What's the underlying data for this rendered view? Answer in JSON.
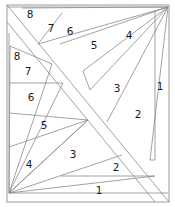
{
  "figure": {
    "title": "",
    "background_color": "#ffffff",
    "stroke_color": "#808080",
    "label_color": "#1a1a1a",
    "width": 175,
    "height": 207,
    "fans": [
      {
        "name": "top-right-fan",
        "apex": "top-right-corner",
        "labels": [
          "1",
          "2",
          "3",
          "4",
          "5",
          "6",
          "7",
          "8"
        ]
      },
      {
        "name": "bottom-left-fan",
        "apex": "bottom-left-corner",
        "labels": [
          "1",
          "2",
          "3",
          "4",
          "5",
          "6",
          "7",
          "8"
        ]
      }
    ],
    "labels": [
      {
        "id": "tr-8",
        "text": "8",
        "x": 30,
        "y": 15
      },
      {
        "id": "tr-7",
        "text": "7",
        "x": 51,
        "y": 29
      },
      {
        "id": "tr-6",
        "text": "6",
        "x": 70,
        "y": 32
      },
      {
        "id": "tr-5",
        "text": "5",
        "x": 94,
        "y": 46
      },
      {
        "id": "tr-4",
        "text": "4",
        "x": 129,
        "y": 36
      },
      {
        "id": "tr-3",
        "text": "3",
        "x": 117,
        "y": 89
      },
      {
        "id": "tr-2",
        "text": "2",
        "x": 138,
        "y": 115
      },
      {
        "id": "tr-1",
        "text": "1",
        "x": 160,
        "y": 87
      },
      {
        "id": "bl-8",
        "text": "8",
        "x": 17,
        "y": 57
      },
      {
        "id": "bl-7",
        "text": "7",
        "x": 28,
        "y": 72
      },
      {
        "id": "bl-6",
        "text": "6",
        "x": 31,
        "y": 98
      },
      {
        "id": "bl-5",
        "text": "5",
        "x": 44,
        "y": 126
      },
      {
        "id": "bl-4",
        "text": "4",
        "x": 29,
        "y": 165
      },
      {
        "id": "bl-3",
        "text": "3",
        "x": 73,
        "y": 155
      },
      {
        "id": "bl-2",
        "text": "2",
        "x": 116,
        "y": 168
      },
      {
        "id": "bl-1",
        "text": "1",
        "x": 99,
        "y": 191
      }
    ]
  }
}
